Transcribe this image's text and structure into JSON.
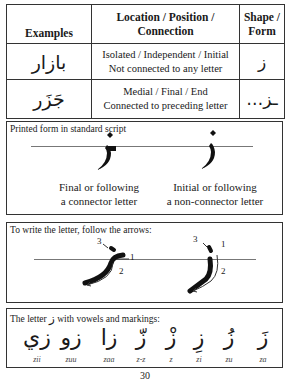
{
  "table": {
    "headers": {
      "examples": "Examples",
      "location": "Location / Position / Connection",
      "shape": "Shape / Form"
    },
    "rows": [
      {
        "example": "بازار",
        "location_line1": "Isolated / Independent / Initial",
        "location_line2": "Not connected to any letter",
        "shape": "ز"
      },
      {
        "example": "جَزَر",
        "location_line1": "Medial / Final / End",
        "location_line2": "Connected to preceding letter",
        "shape": "…ـز"
      }
    ]
  },
  "printed_box": {
    "title": "Printed form in standard script",
    "left": {
      "glyph": "ـز",
      "caption_line1": "Final or following",
      "caption_line2": "a connector letter"
    },
    "right": {
      "glyph": "ز",
      "caption_line1": "Initial or following",
      "caption_line2": "a non-connector letter"
    }
  },
  "stroke_box": {
    "title": "To write the letter, follow the arrows:",
    "left_labels": [
      "1",
      "2",
      "3"
    ],
    "right_labels": [
      "1",
      "2",
      "3"
    ]
  },
  "vowel_box": {
    "title_before": "The letter",
    "title_letter": "ز",
    "title_after": "with vowels and markings:",
    "items": [
      {
        "glyph": "زي",
        "translit": "zii"
      },
      {
        "glyph": "زو",
        "translit": "zuu"
      },
      {
        "glyph": "زا",
        "translit": "zaa"
      },
      {
        "glyph": "زّ",
        "translit": "z-z"
      },
      {
        "glyph": "زْ",
        "translit": "z"
      },
      {
        "glyph": "زِ",
        "translit": "zi"
      },
      {
        "glyph": "زُ",
        "translit": "zu"
      },
      {
        "glyph": "زَ",
        "translit": "za"
      }
    ]
  },
  "page_number": "30"
}
